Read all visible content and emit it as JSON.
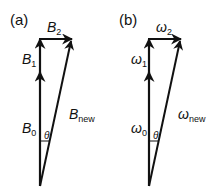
{
  "panels": [
    {
      "id": "a",
      "panel_label": "(a)",
      "labels": {
        "v0": "B",
        "v0_sub": "0",
        "v1": "B",
        "v1_sub": "1",
        "v2": "B",
        "v2_sub": "2",
        "vnew": "B",
        "vnew_sub": "new",
        "angle": "θ"
      }
    },
    {
      "id": "b",
      "panel_label": "(b)",
      "labels": {
        "v0": "ω",
        "v0_sub": "0",
        "v1": "ω",
        "v1_sub": "1",
        "v2": "ω",
        "v2_sub": "2",
        "vnew": "ω",
        "vnew_sub": "new",
        "angle": "θ"
      }
    }
  ],
  "colors": {
    "stroke": "#111111",
    "background": "#ffffff"
  }
}
